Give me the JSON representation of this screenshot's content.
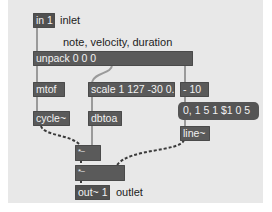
{
  "patcher": {
    "background_color": "#e8e8e8",
    "object_color": "#5a5a5a",
    "text_color": "#f2f2f2",
    "objects": {
      "inlet": "in 1",
      "unpack": "unpack 0 0 0",
      "mtof": "mtof",
      "scale": "scale 1 127 -30 0.",
      "minus": "- 10",
      "message": "0, 1 5 1 $1 0 5",
      "cycle": "cycle~",
      "dbtoa": "dbtoa",
      "line": "line~",
      "mult1": "*~",
      "mult2": "*~",
      "outlet": "out~ 1"
    },
    "comments": {
      "inlet": "inlet",
      "unpack": "note, velocity, duration",
      "outlet": "outlet"
    }
  }
}
